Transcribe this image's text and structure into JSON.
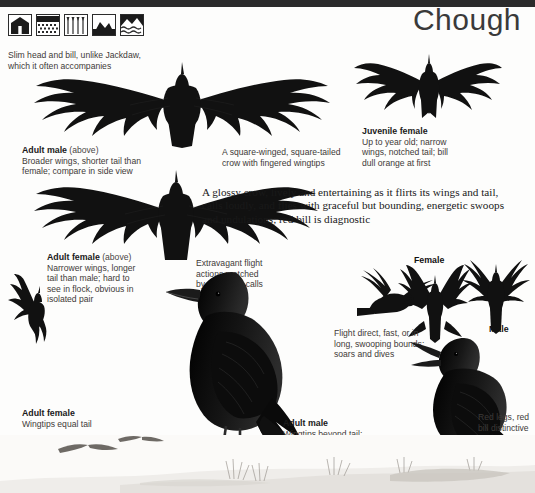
{
  "page": {
    "title": "Chough",
    "accent_dark": "#1a1a1a",
    "background": "#fdfdfc"
  },
  "habitat_icons": [
    {
      "name": "buildings-habitat-icon",
      "label": "buildings"
    },
    {
      "name": "farmland-habitat-icon",
      "label": "farmland"
    },
    {
      "name": "grassland-habitat-icon",
      "label": "grassland"
    },
    {
      "name": "mountain-habitat-icon",
      "label": "mountain"
    },
    {
      "name": "coast-habitat-icon",
      "label": "coast"
    }
  ],
  "captions": {
    "slim_head": "Slim head and bill, unlike Jackdaw,\nwhich it often accompanies",
    "adult_male_flight": {
      "title": "Adult male",
      "title_suffix": "(above)",
      "text": "Broader wings, shorter tail than\nfemale; compare in side view"
    },
    "square_winged": "A square-winged, square-tailed\ncrow with fingered wingtips",
    "juvenile_female": {
      "title": "Juvenile female",
      "text": "Up to year old; narrow\nwings, notched tail; bill\ndull orange at first"
    },
    "adult_female_flight": {
      "title": "Adult female",
      "title_suffix": "(above)",
      "text": "Narrower wings, longer\ntail than male; hard to\nsee in flock, obvious in\nisolated pair"
    },
    "extravagant": "Extravagant flight\nactions matched\nby explosive calls",
    "flight_direct": "Flight direct, fast, or in\nlong, swooping bounds;\nsoars and dives",
    "adult_female_perched": {
      "title": "Adult female",
      "text": "Wingtips equal tail"
    },
    "adult_male_perched": {
      "title": "Adult male",
      "text": "Wingtips beyond tail;\nshaggy undertail coverts"
    },
    "red_legs": "Red legs, red\nbill distinctive"
  },
  "description": "A glossy crow, lively and entertaining as it flirts its wings and tail, calls loudly, and flies with graceful but bounding, energetic swoops and undulations; red bill is diagnostic",
  "labels": {
    "female": "Female",
    "male": "Male"
  }
}
